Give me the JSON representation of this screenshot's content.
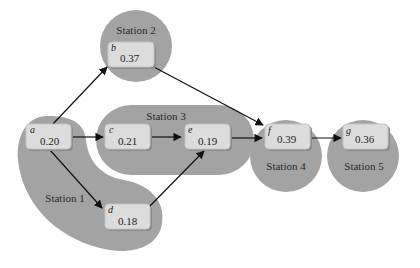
{
  "diagram": {
    "type": "precedence-diagram-line-balancing",
    "colors": {
      "station_fill": "#a3a3a3",
      "task_box_fill": "#dcdcdc",
      "edge": "#111111",
      "text": "#222222"
    },
    "stations": [
      {
        "id": "station-1",
        "label": "Station 1",
        "tasks": [
          "a",
          "d"
        ]
      },
      {
        "id": "station-2",
        "label": "Station 2",
        "tasks": [
          "b"
        ]
      },
      {
        "id": "station-3",
        "label": "Station 3",
        "tasks": [
          "c",
          "e"
        ]
      },
      {
        "id": "station-4",
        "label": "Station 4",
        "tasks": [
          "f"
        ]
      },
      {
        "id": "station-5",
        "label": "Station 5",
        "tasks": [
          "g"
        ]
      }
    ],
    "tasks": {
      "a": {
        "letter": "a",
        "time": "0.20"
      },
      "b": {
        "letter": "b",
        "time": "0.37"
      },
      "c": {
        "letter": "c",
        "time": "0.21"
      },
      "d": {
        "letter": "d",
        "time": "0.18"
      },
      "e": {
        "letter": "e",
        "time": "0.19"
      },
      "f": {
        "letter": "f",
        "time": "0.39"
      },
      "g": {
        "letter": "g",
        "time": "0.36"
      }
    },
    "edges": [
      {
        "from": "a",
        "to": "b"
      },
      {
        "from": "a",
        "to": "c"
      },
      {
        "from": "a",
        "to": "d"
      },
      {
        "from": "b",
        "to": "f"
      },
      {
        "from": "c",
        "to": "e"
      },
      {
        "from": "d",
        "to": "e"
      },
      {
        "from": "e",
        "to": "f"
      },
      {
        "from": "f",
        "to": "g"
      }
    ]
  }
}
